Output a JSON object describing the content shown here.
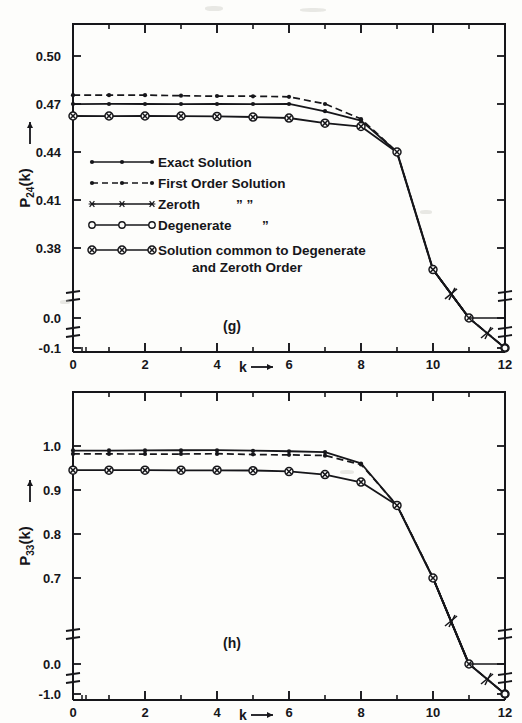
{
  "figure": {
    "background": "#fdfdfb",
    "ink": "#16161a",
    "panels": [
      {
        "id": "panel-g",
        "label": "(g)",
        "ylabel": "P",
        "ylabel_sub": "24",
        "ylabel_tail": "(k)",
        "ylabel_arrow": "→",
        "xlabel": "k",
        "xlabel_arrow": "→"
      },
      {
        "id": "panel-h",
        "label": "(h)",
        "ylabel": "P",
        "ylabel_sub": "33",
        "ylabel_tail": "(k)",
        "ylabel_arrow": "→",
        "xlabel": "k",
        "xlabel_arrow": "→"
      }
    ]
  },
  "legend": {
    "items": [
      {
        "label": "Exact Solution",
        "marker": "filled-dot",
        "line": "solid",
        "extra": ""
      },
      {
        "label": "First Order Solution",
        "marker": "filled-dot",
        "line": "dashed",
        "extra": ""
      },
      {
        "label": "Zeroth",
        "marker": "star",
        "line": "solid",
        "extra": "”          ”"
      },
      {
        "label": "Degenerate",
        "marker": "open-circle",
        "line": "solid",
        "extra": "”"
      },
      {
        "label": "Solution common to Degenerate",
        "label2": "and Zeroth Order",
        "marker": "circled-cross",
        "line": "solid",
        "extra": ""
      }
    ]
  },
  "chart_data": [
    {
      "type": "line",
      "id": "panel-g",
      "title": "(g)",
      "xlabel": "k",
      "ylabel": "P_24(k)",
      "xlim": [
        0,
        12
      ],
      "xticks": [
        0,
        2,
        4,
        6,
        8,
        10,
        12
      ],
      "xminor": [
        1,
        3,
        5,
        7,
        9,
        11
      ],
      "yticks": [
        0.5,
        0.47,
        0.44,
        0.41,
        0.38
      ],
      "ytick_labels": [
        "0.50",
        "0.47",
        "0.44",
        "0.41",
        "0.38"
      ],
      "ylim": [
        0.365,
        0.515
      ],
      "broken_axis": true,
      "break_labels": [
        "0.0",
        "-0.1"
      ],
      "grid": false,
      "legend_position": "inside-left",
      "series": [
        {
          "name": "Exact Solution",
          "marker": "filled-dot",
          "line": "solid",
          "x": [
            0,
            1,
            2,
            3,
            4,
            5,
            6,
            7,
            8,
            9,
            10,
            11,
            12
          ],
          "y": [
            0.47,
            0.47,
            0.47,
            0.47,
            0.47,
            0.47,
            0.47,
            0.4655,
            0.4595,
            0.44,
            0.3665,
            0.005,
            -0.1
          ]
        },
        {
          "name": "First Order Solution",
          "marker": "filled-dot",
          "line": "dashed",
          "x": [
            0,
            1,
            2,
            3,
            4,
            5,
            6,
            7,
            8,
            9,
            10,
            11,
            12
          ],
          "y": [
            0.4755,
            0.4755,
            0.4755,
            0.4752,
            0.475,
            0.4748,
            0.4745,
            0.47,
            0.4605,
            0.44,
            0.3665,
            0.005,
            -0.1
          ]
        },
        {
          "name": "Solution common to Degenerate and Zeroth Order",
          "marker": "circled-cross",
          "line": "solid",
          "x": [
            0,
            1,
            2,
            3,
            4,
            5,
            6,
            7,
            8,
            9,
            10,
            11,
            12
          ],
          "y": [
            0.4625,
            0.4625,
            0.4625,
            0.4625,
            0.4622,
            0.4618,
            0.4612,
            0.458,
            0.456,
            0.44,
            0.3665,
            0.005,
            -0.1
          ]
        }
      ]
    },
    {
      "type": "line",
      "id": "panel-h",
      "title": "(h)",
      "xlabel": "k",
      "ylabel": "P_33(k)",
      "xlim": [
        0,
        12
      ],
      "xticks": [
        0,
        2,
        4,
        6,
        8,
        10,
        12
      ],
      "xminor": [
        1,
        3,
        5,
        7,
        9,
        11
      ],
      "yticks": [
        1.0,
        0.9,
        0.8,
        0.7
      ],
      "ytick_labels": [
        "1.0",
        "0.9",
        "0.8",
        "0.7"
      ],
      "ylim": [
        0.66,
        1.03
      ],
      "broken_axis": true,
      "break_labels": [
        "0.0",
        "-1.0"
      ],
      "grid": false,
      "legend_position": "none",
      "series": [
        {
          "name": "Exact Solution",
          "marker": "filled-dot",
          "line": "solid",
          "x": [
            0,
            1,
            2,
            3,
            4,
            5,
            6,
            7,
            8,
            9,
            10,
            11,
            12
          ],
          "y": [
            0.99,
            0.99,
            0.99,
            0.99,
            0.99,
            0.989,
            0.988,
            0.986,
            0.96,
            0.865,
            0.7,
            0.01,
            -1.0
          ]
        },
        {
          "name": "First Order Solution",
          "marker": "filled-dot",
          "line": "dashed",
          "x": [
            0,
            1,
            2,
            3,
            4,
            5,
            6,
            7,
            8,
            9,
            10,
            11,
            12
          ],
          "y": [
            0.982,
            0.982,
            0.982,
            0.982,
            0.982,
            0.981,
            0.98,
            0.978,
            0.958,
            0.865,
            0.7,
            0.01,
            -1.0
          ]
        },
        {
          "name": "Solution common to Degenerate and Zeroth Order",
          "marker": "circled-cross",
          "line": "solid",
          "x": [
            0,
            1,
            2,
            3,
            4,
            5,
            6,
            7,
            8,
            9,
            10,
            11,
            12
          ],
          "y": [
            0.945,
            0.945,
            0.945,
            0.945,
            0.945,
            0.944,
            0.942,
            0.935,
            0.918,
            0.865,
            0.7,
            0.01,
            -1.0
          ]
        }
      ]
    }
  ]
}
